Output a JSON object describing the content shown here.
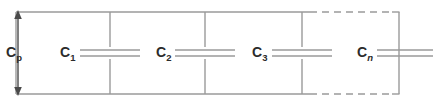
{
  "figure": {
    "stroke_color": "#9a9a9a",
    "text_color": "#2b2b2b",
    "background_color": "#ffffff"
  },
  "labels": {
    "cp": {
      "symbol": "C",
      "subscript": "p",
      "subscript_italic": false
    },
    "c1": {
      "symbol": "C",
      "subscript": "1",
      "subscript_italic": false
    },
    "c2": {
      "symbol": "C",
      "subscript": "2",
      "subscript_italic": false
    },
    "c3": {
      "symbol": "C",
      "subscript": "3",
      "subscript_italic": false
    },
    "cn": {
      "symbol": "C",
      "subscript": "n",
      "subscript_italic": true
    }
  },
  "geometry": {
    "top_rail_y": 12,
    "bottom_rail_y": 94,
    "rail_left_x": 16,
    "rail_right_x": 399,
    "branch_x": [
      110,
      205,
      302,
      399
    ],
    "plate_gap": 6,
    "plate_half_width": 30,
    "dash_start_x": 310,
    "dash_end_x": 392,
    "arrow_x": 18
  }
}
